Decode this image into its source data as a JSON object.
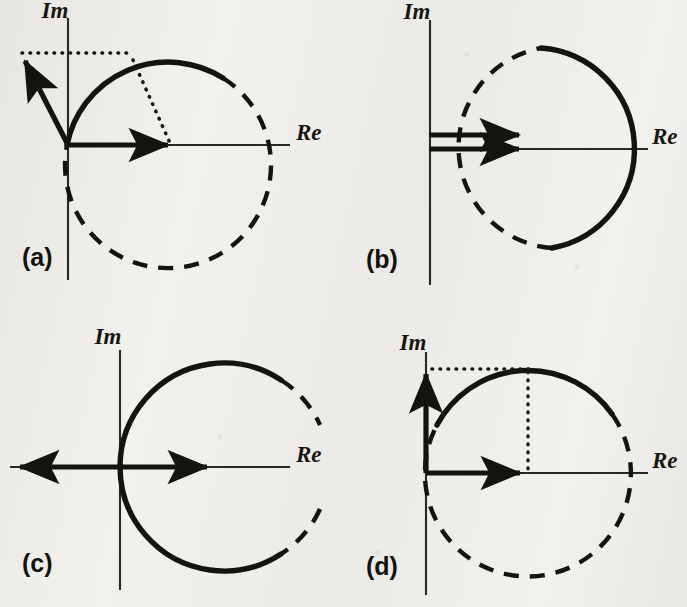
{
  "figure": {
    "background_color": "#f2f1ee",
    "ink_color": "#151310",
    "width": 687,
    "height": 607
  },
  "axis_labels": {
    "real": "Re",
    "imaginary": "Im"
  },
  "panels": [
    {
      "id": "a",
      "label": "(a)",
      "label_x": 22,
      "label_y": 266,
      "origin": {
        "x": 68,
        "y": 145
      },
      "im_axis": {
        "x": 68,
        "y_top": 18,
        "y_bottom": 280
      },
      "re_axis": {
        "y": 145,
        "x_left": 68,
        "x_right": 290
      },
      "re_label_x": 296,
      "re_label_y": 140,
      "im_label_x": 55,
      "im_label_y": 18,
      "circle": {
        "cx": 170,
        "cy": 145,
        "r": 103
      },
      "solid_arc_start_deg": 180,
      "solid_arc_end_deg": 59,
      "re_axis_arrow": {
        "x1": 68,
        "y1": 145,
        "x2": 175,
        "y2": 145
      },
      "vector_arrow": {
        "x1": 68,
        "y1": 145,
        "x2": 21,
        "y2": 54
      },
      "dotted_horizontal": {
        "y": 53,
        "x1": 22,
        "x2": 132
      },
      "dotted_radius": {
        "x1": 132,
        "y1": 60,
        "x2": 170,
        "y2": 143
      }
    },
    {
      "id": "b",
      "label": "(b)",
      "label_x": 366,
      "label_y": 268,
      "origin": {
        "x": 430,
        "y": 149
      },
      "im_axis": {
        "x": 430,
        "y_top": 20,
        "y_bottom": 285
      },
      "re_axis": {
        "y": 149,
        "x_left": 430,
        "x_right": 648
      },
      "re_label_x": 652,
      "re_label_y": 144,
      "im_label_x": 417,
      "im_label_y": 19,
      "circle": {
        "cx": 531,
        "cy": 149,
        "r": 101
      },
      "solid_arc_start_deg": 84,
      "solid_arc_end_deg": -78,
      "arrow_upper": {
        "x1": 429,
        "y1": 135,
        "x2": 527,
        "y2": 135
      },
      "arrow_lower": {
        "x1": 429,
        "y1": 149,
        "x2": 527,
        "y2": 149
      }
    },
    {
      "id": "c",
      "label": "(c)",
      "label_x": 22,
      "label_y": 572,
      "origin": {
        "x": 120,
        "y": 467
      },
      "im_axis": {
        "x": 120,
        "y_top": 350,
        "y_bottom": 590
      },
      "re_axis": {
        "y": 467,
        "x_left": 10,
        "x_right": 290
      },
      "re_label_x": 296,
      "re_label_y": 462,
      "im_label_x": 108,
      "im_label_y": 344,
      "circle": {
        "cx": 224,
        "cy": 467,
        "r": 104
      },
      "solid_arc_start_deg": 57,
      "solid_arc_end_deg": -57,
      "re_arrow_right": {
        "x1": 120,
        "y1": 467,
        "x2": 215,
        "y2": 467
      },
      "re_arrow_left": {
        "x1": 120,
        "y1": 467,
        "x2": 12,
        "y2": 467
      }
    },
    {
      "id": "d",
      "label": "(d)",
      "label_x": 366,
      "label_y": 575,
      "origin": {
        "x": 426,
        "y": 473
      },
      "im_axis": {
        "x": 426,
        "y_top": 352,
        "y_bottom": 595
      },
      "re_axis": {
        "y": 473,
        "x_left": 426,
        "x_right": 648
      },
      "re_label_x": 652,
      "re_label_y": 468,
      "im_label_x": 413,
      "im_label_y": 350,
      "circle": {
        "cx": 528,
        "cy": 473,
        "r": 103
      },
      "solid_arc_start_deg": 152,
      "solid_arc_end_deg": 35,
      "im_arrow": {
        "x1": 426,
        "y1": 473,
        "x2": 426,
        "y2": 366
      },
      "re_arrow": {
        "x1": 426,
        "y1": 473,
        "x2": 528,
        "y2": 473
      },
      "dotted_horizontal": {
        "y": 369,
        "x1": 432,
        "x2": 528
      },
      "dotted_vertical": {
        "x": 528,
        "y1": 369,
        "y2": 471
      }
    }
  ]
}
